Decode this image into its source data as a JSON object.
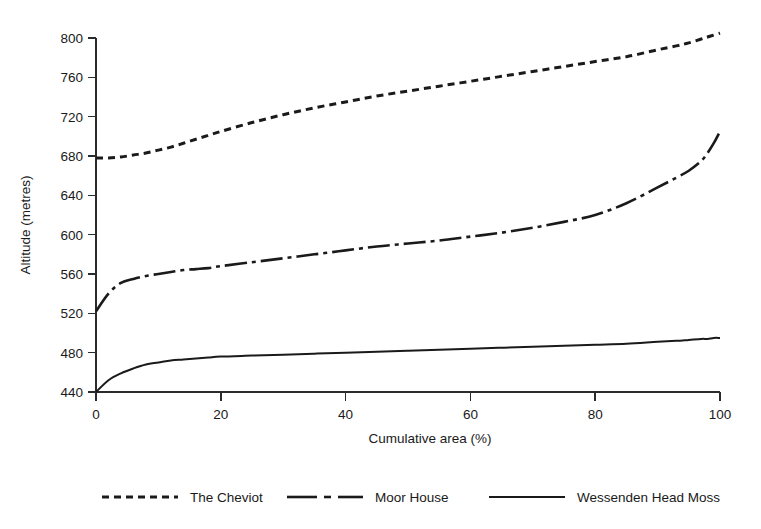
{
  "chart_data": {
    "type": "line",
    "title": "",
    "xlabel": "Cumulative area (%)",
    "ylabel": "Altitude (metres)",
    "xlim": [
      0,
      100
    ],
    "ylim": [
      440,
      800
    ],
    "xticks": [
      0,
      20,
      40,
      60,
      80,
      100
    ],
    "yticks": [
      440,
      480,
      520,
      560,
      600,
      640,
      680,
      720,
      760,
      800
    ],
    "xtick_labels": [
      "0",
      "20",
      "40",
      "60",
      "80",
      "100"
    ],
    "ytick_labels": [
      "440",
      "480",
      "520",
      "560",
      "600",
      "640",
      "680",
      "720",
      "760",
      "800"
    ],
    "grid": false,
    "legend_position": "below",
    "x": [
      0,
      2,
      4,
      6,
      8,
      10,
      12,
      14,
      16,
      18,
      20,
      25,
      30,
      35,
      40,
      45,
      50,
      55,
      60,
      65,
      70,
      75,
      80,
      85,
      90,
      93,
      95,
      97,
      98,
      99,
      100
    ],
    "series": [
      {
        "name": "The Cheviot",
        "line_style": "dashed",
        "color": "#1a1a1a",
        "values": [
          678,
          678,
          679,
          681,
          683,
          686,
          689,
          693,
          697,
          701,
          705,
          714,
          722,
          729,
          735,
          741,
          746,
          751,
          756,
          761,
          766,
          771,
          776,
          781,
          788,
          792,
          795,
          799,
          801,
          803,
          805
        ]
      },
      {
        "name": "Moor House",
        "line_style": "dashdot",
        "color": "#1a1a1a",
        "values": [
          522,
          540,
          551,
          555,
          558,
          560,
          562,
          564,
          565,
          566,
          568,
          572,
          576,
          580,
          584,
          588,
          591,
          594,
          598,
          602,
          607,
          613,
          620,
          632,
          648,
          658,
          665,
          675,
          683,
          693,
          705
        ]
      },
      {
        "name": "Wessenden Head Moss",
        "line_style": "solid",
        "color": "#1a1a1a",
        "values": [
          440,
          452,
          459,
          464,
          468,
          470,
          472,
          473,
          474,
          475,
          476,
          477,
          478,
          479,
          480,
          481,
          482,
          483,
          484,
          485,
          486,
          487,
          488,
          489,
          491,
          492,
          493,
          494,
          494,
          495,
          495
        ]
      }
    ]
  },
  "legend": {
    "entries": [
      {
        "label": "The Cheviot",
        "style": "dashed"
      },
      {
        "label": "Moor House",
        "style": "dashdot"
      },
      {
        "label": "Wessenden Head Moss",
        "style": "solid"
      }
    ]
  }
}
